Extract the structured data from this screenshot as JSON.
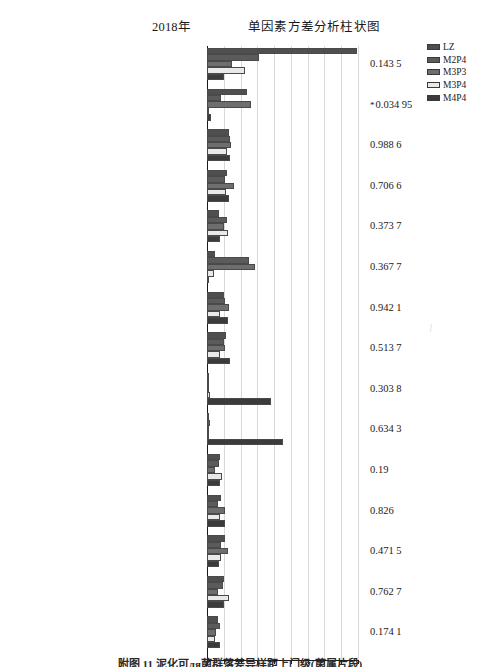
{
  "header": {
    "year_label": "2018年",
    "main_title": "单因素方差分析柱状图"
  },
  "legend": {
    "position": "top-right",
    "items": [
      {
        "label": "LZ",
        "color": "#4f4f4f"
      },
      {
        "label": "M2P4",
        "color": "#5b5b5b"
      },
      {
        "label": "M3P3",
        "color": "#6e6e6e"
      },
      {
        "label": "M3P4",
        "color": "#e9e9e9"
      },
      {
        "label": "M4P4",
        "color": "#3b3b3b"
      }
    ]
  },
  "axis": {
    "xlabel": "平均比例(%)",
    "ticks": [
      "0",
      "2",
      "4",
      "6",
      "8",
      "10",
      "12",
      "14",
      "16",
      "18"
    ]
  },
  "caption": "附图 11  泥化可ля菌群落差异样距上门级(菌属片段)",
  "chart_data": {
    "type": "bar",
    "orientation": "horizontal",
    "title": "单因素方差分析柱状图",
    "subtitle": "2018年",
    "xlabel": "平均比例(%)",
    "ylabel": "",
    "xlim": [
      0,
      18
    ],
    "grid": true,
    "legend_position": "top-right",
    "series_names": [
      "LZ",
      "M2P4",
      "M3P3",
      "M3P4",
      "M4P4"
    ],
    "categories": [
      "Enterobacter",
      "Sphingobium",
      "norank_o_Gaiellales",
      "norank_f_ODP1230B8.23",
      "unclassified_f_Acidobacteriaceae_Subgroup_1_",
      "Pantoea",
      "norank_p_Saccharibacteria",
      "Mizugakiibacter",
      "Enterococcus",
      "Bifidobacterium",
      "norank_f_DA111",
      "Sphingomonas",
      "norank_f_Acidobacteriaceae_Subgroup_1_",
      "unclassified_k_norank",
      "Acidibacter"
    ],
    "p_values": [
      "0.143 5",
      "0.034 95",
      "0.988 6",
      "0.706 6",
      "0.373 7",
      "0.367 7",
      "0.942 1",
      "0.513 7",
      "0.303 8",
      "0.634 3",
      "0.19",
      "0.826",
      "0.471 5",
      "0.762 7",
      "0.174 1"
    ],
    "significant": [
      false,
      true,
      false,
      false,
      false,
      false,
      false,
      false,
      false,
      false,
      false,
      false,
      false,
      false,
      false
    ],
    "series": [
      {
        "name": "LZ",
        "values": [
          17.9,
          4.8,
          2.6,
          2.4,
          1.4,
          1.0,
          2.0,
          2.3,
          0.05,
          0.0,
          1.6,
          1.7,
          2.1,
          2.0,
          1.3
        ]
      },
      {
        "name": "M2P4",
        "values": [
          6.2,
          1.7,
          2.8,
          2.1,
          2.4,
          5.0,
          2.2,
          2.0,
          0.05,
          0.3,
          1.4,
          1.3,
          1.7,
          1.9,
          1.5
        ]
      },
      {
        "name": "M3P3",
        "values": [
          3.0,
          5.3,
          2.9,
          3.2,
          2.0,
          5.7,
          2.6,
          2.1,
          0.05,
          0.0,
          0.9,
          2.2,
          2.5,
          1.3,
          1.1
        ]
      },
      {
        "name": "M3P4",
        "values": [
          4.5,
          0.2,
          2.4,
          2.3,
          2.5,
          0.8,
          1.6,
          1.6,
          0.3,
          0.05,
          1.8,
          1.5,
          1.7,
          2.6,
          1.0
        ]
      },
      {
        "name": "M4P4",
        "values": [
          2.0,
          0.5,
          2.7,
          2.6,
          1.5,
          0.1,
          2.5,
          2.8,
          7.6,
          9.0,
          1.6,
          2.1,
          1.4,
          2.0,
          1.6
        ]
      }
    ]
  }
}
